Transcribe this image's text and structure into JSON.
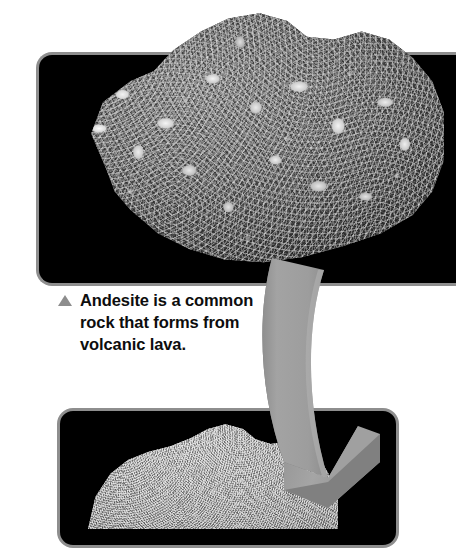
{
  "page": {
    "background_color": "#ffffff",
    "width": 438,
    "height": 522
  },
  "panels": [
    {
      "id": "panel-top",
      "name": "andesite-photo-panel",
      "background_color": "#000000",
      "border_color": "#8e8e8e",
      "specimen": {
        "name": "andesite-rock-specimen",
        "description": "Dark gray porphyritic andesite rock with white phenocrysts"
      }
    },
    {
      "id": "panel-bottom",
      "name": "second-rock-photo-panel",
      "background_color": "#000000",
      "border_color": "#8e8e8e",
      "specimen": {
        "name": "granular-rock-specimen",
        "description": "Light gray fine-grained granular rock"
      }
    }
  ],
  "caption": {
    "bullet_icon": "triangle-up-icon",
    "bullet_color": "#8d8d8d",
    "text": "Andesite is a common\nrock that forms from\nvolcanic lava.",
    "text_color": "#0d0d0d"
  },
  "arrow": {
    "name": "curved-flow-arrow",
    "direction": "down",
    "fill_color": "#9a9a9a",
    "shadow_color": "#757575",
    "edge_color": "#6f6f6f"
  }
}
